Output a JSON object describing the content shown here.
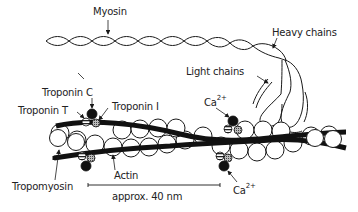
{
  "figure": {
    "labels": {
      "myosin": "Myosin",
      "heavy_chains": "Heavy chains",
      "light_chains": "Light chains",
      "troponin_c": "Troponin C",
      "troponin_t": "Troponin T",
      "troponin_i": "Troponin I",
      "ca_top": "Ca",
      "ca_top_sup": "2+",
      "ca_bottom": "Ca",
      "ca_bottom_sup": "2+",
      "actin": "Actin",
      "tropomyosin": "Tropomyosin",
      "scale": "approx. 40 nm"
    },
    "colors": {
      "ink": "#1a1a1a",
      "background": "#ffffff"
    }
  }
}
